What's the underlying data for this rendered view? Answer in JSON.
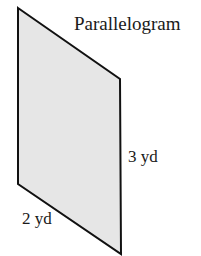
{
  "diagram": {
    "title": "Parallelogram",
    "shape": "parallelogram",
    "fill_color": "#e6e6e6",
    "stroke_color": "#111111",
    "vertices": [
      [
        18,
        8
      ],
      [
        120,
        79
      ],
      [
        121,
        254
      ],
      [
        18,
        184
      ]
    ],
    "labels": {
      "vertical_side": "3 yd",
      "slanted_side": "2 yd"
    }
  }
}
